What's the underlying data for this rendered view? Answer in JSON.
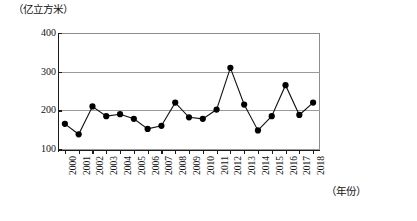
{
  "chart_data": {
    "type": "line",
    "title": "",
    "subtitle": "",
    "xlabel": "（年份）",
    "ylabel": "（亿立方米）",
    "y_unit_caption": "（亿立方米）",
    "x_unit_caption": "（年份）",
    "categories": [
      "2000",
      "2001",
      "2002",
      "2003",
      "2004",
      "2005",
      "2006",
      "2007",
      "2008",
      "2009",
      "2010",
      "2011",
      "2012",
      "2013",
      "2014",
      "2015",
      "2016",
      "2017",
      "2018"
    ],
    "values": [
      165,
      138,
      210,
      185,
      190,
      178,
      152,
      160,
      220,
      182,
      178,
      202,
      310,
      215,
      148,
      185,
      265,
      188,
      220
    ],
    "series": [
      {
        "name": "用水量",
        "values": [
          165,
          138,
          210,
          185,
          190,
          178,
          152,
          160,
          220,
          182,
          178,
          202,
          310,
          215,
          148,
          185,
          265,
          188,
          220
        ]
      }
    ],
    "ylim": [
      0,
      400
    ],
    "yticks": [
      0,
      100,
      200,
      300,
      400
    ],
    "ytick_labels": [
      "",
      "100",
      "200",
      "300",
      "400"
    ],
    "xlim": [
      "2000",
      "2018"
    ],
    "grid": true,
    "grid_axis": "y",
    "legend": false,
    "legend_position": "none",
    "marker": "filled-circle",
    "line_color": "#111111",
    "marker_color": "#000000",
    "grid_color": "#9a9a9a",
    "axis_color": "#1a1a1a",
    "background_color": "#ffffff"
  }
}
